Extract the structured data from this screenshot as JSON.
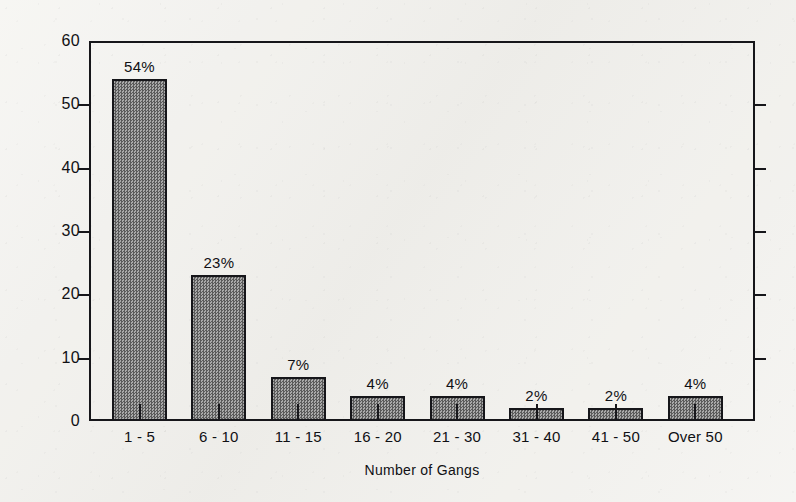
{
  "chart_data": {
    "type": "bar",
    "title": "",
    "xlabel": "Number of Gangs",
    "ylabel": "Percentage",
    "categories": [
      "1 - 5",
      "6 - 10",
      "11 - 15",
      "16 - 20",
      "21 - 30",
      "31 - 40",
      "41 - 50",
      "Over 50"
    ],
    "values": [
      54,
      23,
      7,
      4,
      4,
      2,
      2,
      4
    ],
    "data_labels": [
      "54%",
      "23%",
      "7%",
      "4%",
      "4%",
      "2%",
      "2%",
      "4%"
    ],
    "ylim": [
      0,
      60
    ],
    "yticks": [
      0,
      10,
      20,
      30,
      40,
      50,
      60
    ],
    "ytick_labels": [
      "0",
      "10",
      "20",
      "30",
      "40",
      "50",
      "60"
    ],
    "grid": false,
    "legend": "none",
    "bar_fill_color": "#8d8d8d",
    "bar_edge_color": "#16161a",
    "background_color": "#f2f1ed",
    "axis_color": "#16161a"
  }
}
